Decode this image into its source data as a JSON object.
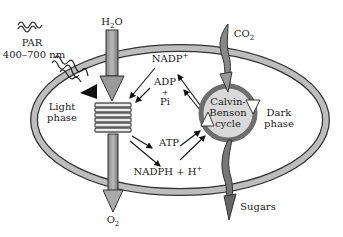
{
  "diagram": {
    "labels": {
      "par": "PAR",
      "par_range": "400–700 nm",
      "h2o": "H",
      "h2o_sub": "2",
      "h2o_tail": "O",
      "co2": "CO",
      "co2_sub": "2",
      "nadp": "NADP",
      "nadp_sup": "+",
      "adp": "ADP",
      "plus": "+",
      "pi": "Pi",
      "light_phase_1": "Light",
      "light_phase_2": "phase",
      "dark_phase_1": "Dark",
      "dark_phase_2": "phase",
      "calvin_1": "Calvin-",
      "calvin_2": "Benson",
      "calvin_3": "cycle",
      "atp": "ATP",
      "nadph": "NADPH + H",
      "nadph_sup": "+",
      "o2": "O",
      "o2_sub": "2",
      "sugars": "Sugars"
    },
    "colors": {
      "membrane_fill": "#bdbdbd",
      "membrane_stroke": "#333333",
      "cycle_fill": "#d9d9d9",
      "cycle_ring": "#6e6e6e",
      "arrow": "#222222"
    }
  }
}
